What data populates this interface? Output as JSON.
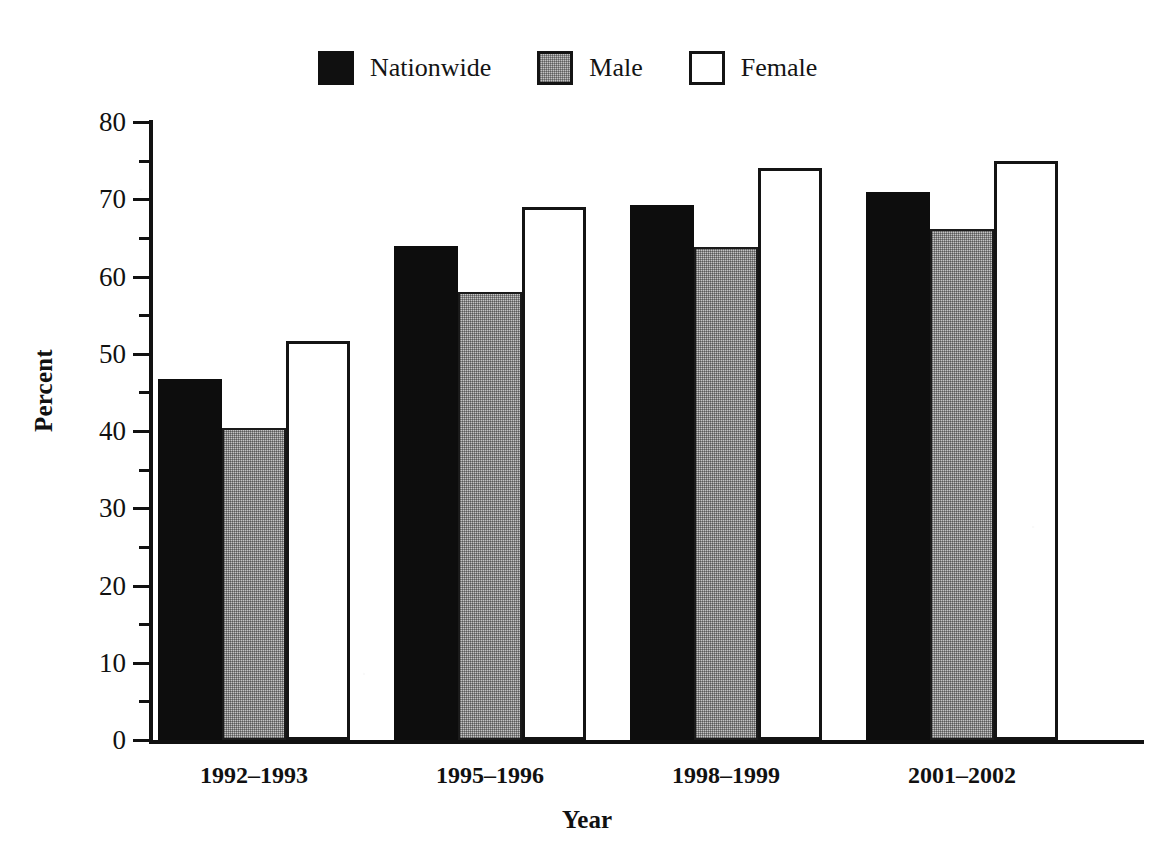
{
  "chart_data": {
    "type": "bar",
    "title": "",
    "xlabel": "Year",
    "ylabel": "Percent",
    "categories": [
      "1992–1993",
      "1995–1996",
      "1998–1999",
      "2001–2002"
    ],
    "series": [
      {
        "name": "Nationwide",
        "color": "#0d0d0d",
        "values": [
          46.7,
          64.0,
          69.3,
          71.0
        ]
      },
      {
        "name": "Male",
        "color": "#c4c4c4",
        "values": [
          40.4,
          58.0,
          63.8,
          66.2
        ]
      },
      {
        "name": "Female",
        "color": "#ffffff",
        "values": [
          51.7,
          69.0,
          74.0,
          74.9
        ]
      }
    ],
    "ylim": [
      0,
      80
    ],
    "ytick_labels": [
      "0",
      "10",
      "20",
      "30",
      "40",
      "50",
      "60",
      "70",
      "80"
    ],
    "ytick_values": [
      0,
      10,
      20,
      30,
      40,
      50,
      60,
      70,
      80
    ],
    "yminor_values": [
      5,
      15,
      25,
      35,
      45,
      55,
      65,
      75
    ],
    "grid": false,
    "legend_position": "top-center"
  },
  "legend": {
    "entries": [
      {
        "label": "Nationwide",
        "swatch": "legend-swatch-nationwide"
      },
      {
        "label": "Male",
        "swatch": "legend-swatch-male"
      },
      {
        "label": "Female",
        "swatch": "legend-swatch-female"
      }
    ]
  },
  "axes": {
    "y_label": "Percent",
    "x_label": "Year"
  }
}
